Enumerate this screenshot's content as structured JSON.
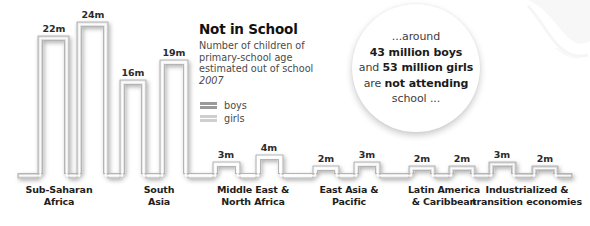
{
  "info": {
    "title": "Not in School",
    "desc_line1": "Number of children of",
    "desc_line2": "primary-school age",
    "desc_line3": "estimated out of school",
    "year": "2007"
  },
  "legend": {
    "boys_label": "boys",
    "girls_label": "girls",
    "boys_color": "#9a9a9a",
    "girls_color": "#cfcfcf"
  },
  "callout": {
    "line1": "...around",
    "line2_bold": "43 million boys",
    "line3_prefix": "and ",
    "line3_bold": "53 million girls",
    "line4_prefix": "are ",
    "line4_bold": "not attending",
    "line5": "school ..."
  },
  "chart_data": {
    "type": "bar",
    "title": "Not in School",
    "subtitle": "Number of children of primary-school age estimated out of school",
    "year": "2007",
    "xlabel": "",
    "ylabel": "Children out of school (millions)",
    "unit": "m",
    "ylim": [
      0,
      26
    ],
    "grid": false,
    "legend_position": "center-left",
    "categories": [
      "Sub-Saharan Africa",
      "South Asia",
      "Middle East & North Africa",
      "East Asia & Pacific",
      "Latin America & Caribbean",
      "Industrialized & transition economies"
    ],
    "series": [
      {
        "name": "boys",
        "values": [
          22,
          16,
          3,
          2,
          2,
          3
        ]
      },
      {
        "name": "girls",
        "values": [
          24,
          19,
          4,
          3,
          2,
          2
        ]
      }
    ],
    "totals": {
      "boys": 43,
      "girls": 53
    }
  },
  "regions": [
    {
      "label_line1": "Sub-Saharan",
      "label_line2": "Africa",
      "label_x": 59,
      "bars": [
        {
          "value_label": "22m",
          "x": 38,
          "width": 31,
          "top": 36,
          "label_x": 54,
          "label_y": 23
        },
        {
          "value_label": "24m",
          "x": 77,
          "width": 31,
          "top": 22,
          "label_x": 93,
          "label_y": 9
        }
      ]
    },
    {
      "label_line1": "South",
      "label_line2": "Asia",
      "label_x": 159,
      "bars": [
        {
          "value_label": "16m",
          "x": 120,
          "width": 26,
          "top": 80,
          "label_x": 133,
          "label_y": 67
        },
        {
          "value_label": "19m",
          "x": 160,
          "width": 28,
          "top": 60,
          "label_x": 174,
          "label_y": 47
        }
      ]
    },
    {
      "label_line1": "Middle East &",
      "label_line2": "North Africa",
      "label_x": 253,
      "bars": [
        {
          "value_label": "3m",
          "x": 213,
          "width": 27,
          "top": 162,
          "label_x": 226,
          "label_y": 149
        },
        {
          "value_label": "4m",
          "x": 256,
          "width": 27,
          "top": 155,
          "label_x": 269,
          "label_y": 142
        }
      ]
    },
    {
      "label_line1": "East Asia &",
      "label_line2": "Pacific",
      "label_x": 349,
      "bars": [
        {
          "value_label": "2m",
          "x": 313,
          "width": 26,
          "top": 166,
          "label_x": 326,
          "label_y": 153
        },
        {
          "value_label": "3m",
          "x": 354,
          "width": 26,
          "top": 162,
          "label_x": 367,
          "label_y": 149
        }
      ]
    },
    {
      "label_line1": "Latin America",
      "label_line2": "& Caribbean",
      "label_x": 444,
      "bars": [
        {
          "value_label": "2m",
          "x": 409,
          "width": 26,
          "top": 166,
          "label_x": 422,
          "label_y": 153
        },
        {
          "value_label": "2m",
          "x": 449,
          "width": 26,
          "top": 166,
          "label_x": 462,
          "label_y": 153
        }
      ]
    },
    {
      "label_line1": "Industrialized &",
      "label_line2": "transition economies",
      "label_x": 527,
      "bars": [
        {
          "value_label": "3m",
          "x": 489,
          "width": 27,
          "top": 162,
          "label_x": 502,
          "label_y": 149
        },
        {
          "value_label": "2m",
          "x": 532,
          "width": 26,
          "top": 166,
          "label_x": 545,
          "label_y": 153
        }
      ]
    }
  ],
  "layout": {
    "baseline_y": 178,
    "ribbon_start_x": 18,
    "ribbon_end_x": 572,
    "stroke_color": "#b4b4b4",
    "fill_color": "#ffffff",
    "region_label_y": 184
  }
}
